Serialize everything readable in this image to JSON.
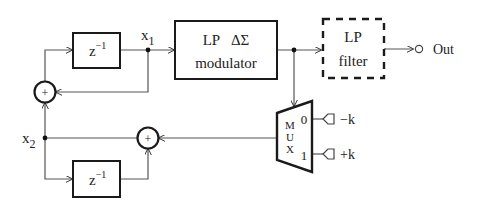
{
  "diagram": {
    "type": "block-diagram",
    "colors": {
      "stroke": "#1a1a1a",
      "wire": "#555555",
      "background": "#ffffff"
    },
    "blocks": {
      "delay_top": {
        "label_base": "z",
        "label_exp": "−1"
      },
      "modulator": {
        "line1": "LP   ΔΣ",
        "line2": "modulator"
      },
      "lp_filter": {
        "line1": "LP",
        "line2": "filter",
        "style": "dashed"
      },
      "delay_bottom": {
        "label_base": "z",
        "label_exp": "−1"
      },
      "mux": {
        "letters": [
          "M",
          "U",
          "X"
        ],
        "port0": "0",
        "port1": "1"
      }
    },
    "summers": {
      "top_left": {
        "symbol": "+"
      },
      "middle": {
        "symbol": "+"
      }
    },
    "signals": {
      "x1": {
        "base": "x",
        "sub": "1"
      },
      "x2": {
        "base": "x",
        "sub": "2"
      },
      "out": "Out",
      "neg_k": "−k",
      "pos_k": "+k"
    }
  }
}
